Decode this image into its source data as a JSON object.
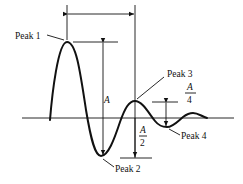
{
  "diagram": {
    "type": "damped-oscillation-response",
    "labels": {
      "peak1": "Peak 1",
      "peak2": "Peak 2",
      "peak3": "Peak 3",
      "peak4": "Peak 4",
      "amplitude": "A",
      "half_num": "A",
      "half_den": "2",
      "quarter_num": "A",
      "quarter_den": "4"
    },
    "colors": {
      "stroke": "#111111",
      "background": "#ffffff"
    }
  }
}
